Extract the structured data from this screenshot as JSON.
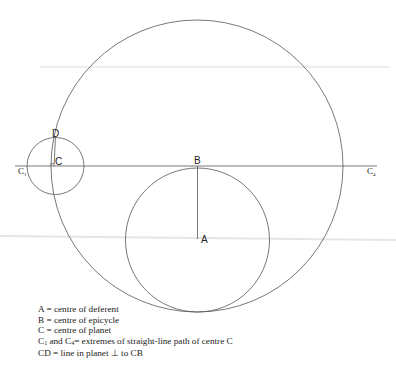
{
  "diagram": {
    "points": {
      "A": "A",
      "B": "B",
      "C": "C",
      "D": "D",
      "C1": "C",
      "C1_sub": "1",
      "C4": "C",
      "C4_sub": "4"
    },
    "circles": [
      {
        "name": "large-circle",
        "cx": 197,
        "cy": 166,
        "r": 146
      },
      {
        "name": "deferent",
        "cx": 197.5,
        "cy": 239.5,
        "r": 72
      },
      {
        "name": "planet-circle",
        "cx": 55.5,
        "cy": 166,
        "r": 28.5
      }
    ],
    "stroke_color": "#555555"
  },
  "legend": {
    "items": [
      {
        "text": "A = centre of deferent"
      },
      {
        "text": "B = centre of epicycle"
      },
      {
        "text": "C = centre of planet"
      },
      {
        "prefix": "C",
        "sub1": "1",
        "mid": " and C",
        "sub2": "4",
        "text": "= extremes of straight-line path of centre C"
      },
      {
        "text": "CD = line in planet ⊥ to CB"
      }
    ]
  }
}
